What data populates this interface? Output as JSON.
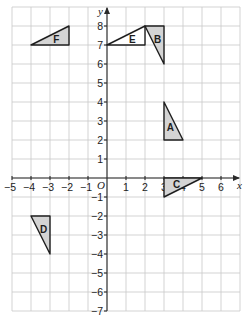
{
  "diagram": {
    "type": "coordinate-grid",
    "x_axis": {
      "label": "x",
      "min": -5,
      "max": 7,
      "tick_labels": [
        "-5",
        "-4",
        "-3",
        "-2",
        "-1",
        "1",
        "2",
        "3",
        "4",
        "5",
        "6"
      ]
    },
    "y_axis": {
      "label": "y",
      "min": -7,
      "max": 9,
      "tick_labels": [
        "8",
        "7",
        "6",
        "5",
        "4",
        "3",
        "2",
        "1",
        "-1",
        "-2",
        "-3",
        "-4",
        "-5",
        "-6",
        "-7"
      ]
    },
    "origin_label": "O",
    "colors": {
      "shaded_fill": "#d4d4d4",
      "unshaded_fill": "#ffffff",
      "grid": "#c8c8c8",
      "outline": "#1e1e1e"
    },
    "shapes": [
      {
        "label": "A",
        "vertices": [
          [
            3,
            4
          ],
          [
            3,
            2
          ],
          [
            4,
            2
          ]
        ],
        "shaded": true
      },
      {
        "label": "B",
        "vertices": [
          [
            2,
            8
          ],
          [
            3,
            8
          ],
          [
            3,
            6
          ]
        ],
        "shaded": true
      },
      {
        "label": "C",
        "vertices": [
          [
            3,
            0
          ],
          [
            5,
            0
          ],
          [
            3,
            -1
          ]
        ],
        "shaded": true
      },
      {
        "label": "D",
        "vertices": [
          [
            -4,
            -2
          ],
          [
            -3,
            -2
          ],
          [
            -3,
            -4
          ]
        ],
        "shaded": true
      },
      {
        "label": "E",
        "vertices": [
          [
            0,
            7
          ],
          [
            2,
            8
          ],
          [
            2,
            7
          ]
        ],
        "shaded": false
      },
      {
        "label": "F",
        "vertices": [
          [
            -4,
            7
          ],
          [
            -2,
            8
          ],
          [
            -2,
            7
          ]
        ],
        "shaded": true
      }
    ]
  }
}
